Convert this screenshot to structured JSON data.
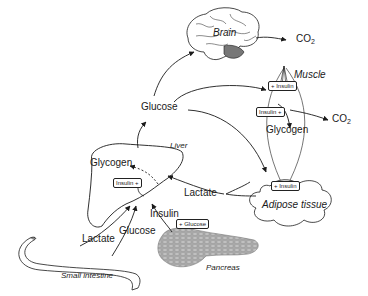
{
  "diagram": {
    "type": "glucose-metabolism-organ-map",
    "organs": {
      "brain": "Brain",
      "muscle": "Muscle",
      "liver": "Liver",
      "adipose": "Adipose tissue",
      "pancreas": "Pancreas",
      "small_intestine": "Small intestine"
    },
    "metabolites": {
      "glucose_center": "Glucose",
      "glycogen_liver": "Glycogen",
      "glycogen_muscle": "Glycogen",
      "lactate_left": "Lactate",
      "lactate_right": "Lactate",
      "glucose_intestine": "Glucose",
      "insulin_pancreas": "Insulin",
      "co2_brain": "CO",
      "co2_brain_sub": "2",
      "co2_muscle": "CO",
      "co2_muscle_sub": "2"
    },
    "boxes": {
      "muscle_plus_insulin": "+ Insulin",
      "muscle_insulin_plus": "Insulin +",
      "liver_insulin_plus": "Insulin +",
      "adipose_plus_insulin": "+ Insulin",
      "pancreas_plus_glucose": "+ Glucose"
    },
    "colors": {
      "line": "#1a1a1a",
      "pancreas_fill": "#a8a8a8",
      "background": "#ffffff"
    }
  }
}
